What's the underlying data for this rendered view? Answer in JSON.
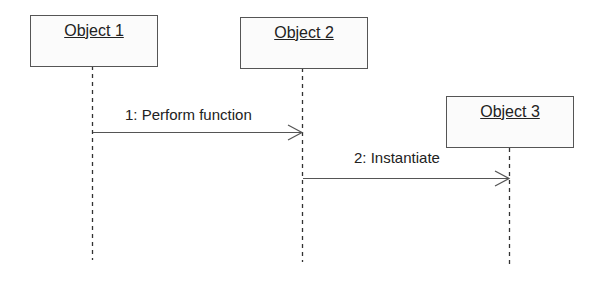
{
  "diagram": {
    "type": "UML sequence diagram",
    "objects": [
      {
        "label": "Object 1"
      },
      {
        "label": "Object 2"
      },
      {
        "label": "Object 3"
      }
    ],
    "messages": [
      {
        "label": "1: Perform function",
        "from": "Object 1",
        "to": "Object 2"
      },
      {
        "label": "2: Instantiate",
        "from": "Object 2",
        "to": "Object 3"
      }
    ]
  }
}
